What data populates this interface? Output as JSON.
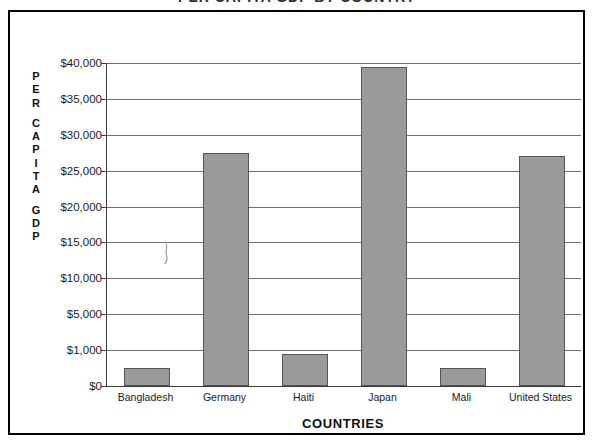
{
  "title": "PER CAPITA GDP BY COUNTRY",
  "y_axis_caption_lines": [
    "P",
    "E",
    "R",
    "",
    "C",
    "A",
    "P",
    "I",
    "T",
    "A",
    "",
    "G",
    "D",
    "P"
  ],
  "chart_data": {
    "type": "bar",
    "title": "PER CAPITA GDP BY COUNTRY",
    "xlabel": "COUNTRIES",
    "ylabel": "PER CAPITA GDP",
    "categories": [
      "Bangladesh",
      "Germany",
      "Haiti",
      "Japan",
      "Mali",
      "United States"
    ],
    "values": [
      500,
      27500,
      900,
      39500,
      500,
      27100
    ],
    "value_labels": [
      "$500",
      "$27,500",
      "$900",
      "$39,500",
      "$500",
      "$27,100"
    ],
    "ytick_labels": [
      "$40,000",
      "$35,000",
      "$30,000",
      "$25,000",
      "$20,000",
      "$15,000",
      "$10,000",
      "$5,000",
      "$1,000",
      "$0"
    ],
    "ytick_values": [
      40000,
      35000,
      30000,
      25000,
      20000,
      15000,
      10000,
      5000,
      1000,
      0
    ],
    "axis_scale": "non-uniform: equal spacing between listed ticks",
    "grid": true,
    "legend": "none",
    "bar_color": "#9a9a9a",
    "bar_border_color": "#555555",
    "ylim": [
      0,
      40000
    ]
  },
  "colors": {
    "bar_fill": "#9a9a9a",
    "bar_stroke": "#555555",
    "gridline": "#6e6e6e",
    "axis": "#3a3a3a",
    "frame": "#000000",
    "text": "#1a1a1a"
  }
}
